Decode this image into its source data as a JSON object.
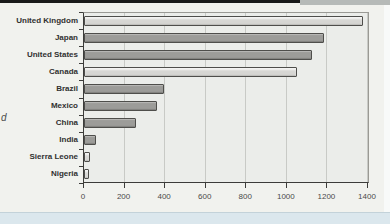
{
  "chrome": {
    "top_bar_dark_color": "#1a1a1a",
    "top_bar_gray_color": "#b6bab8",
    "page_bg_color": "#dbe7ed",
    "panel_bg_color": "#f1f2ee"
  },
  "side_label_fragment": "d",
  "chart_data": {
    "type": "bar",
    "orientation": "horizontal",
    "title": "",
    "xlabel": "",
    "ylabel": "",
    "categories": [
      "United Kingdom",
      "Japan",
      "United States",
      "Canada",
      "Brazil",
      "Mexico",
      "China",
      "India",
      "Sierra Leone",
      "Nigeria"
    ],
    "values": [
      1370,
      1180,
      1120,
      1045,
      390,
      355,
      250,
      55,
      25,
      20
    ],
    "bar_shades": [
      "light",
      "dark",
      "dark",
      "light",
      "dark",
      "dark",
      "dark",
      "dark",
      "light",
      "light"
    ],
    "bar_fill_light": "#d6d6d3",
    "bar_fill_dark": "#9c9c99",
    "bar_border_color": "#4e4e4b",
    "xlim": [
      0,
      1400
    ],
    "xticks": [
      0,
      200,
      400,
      600,
      800,
      1000,
      1200,
      1400
    ],
    "grid": true,
    "legend": false,
    "plot_bg_color": "#ebedea",
    "gridline_color": "#c8cac6",
    "axis_color": "#3c3c3a",
    "category_label_color": "#303030",
    "tick_label_color": "#4a4a4a"
  }
}
